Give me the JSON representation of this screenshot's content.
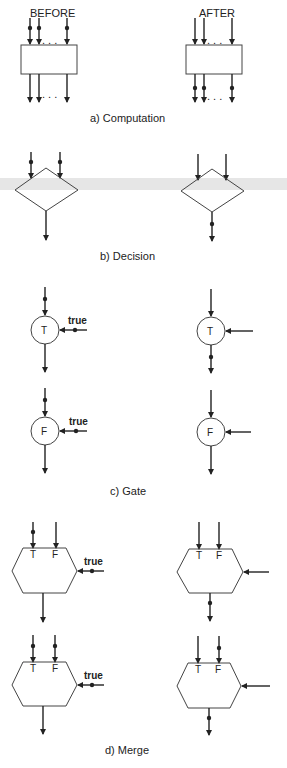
{
  "headers": {
    "before": "BEFORE",
    "after": "AFTER"
  },
  "captions": {
    "computation": "a) Computation",
    "decision": "b) Decision",
    "gate": "c) Gate",
    "merge": "d) Merge"
  },
  "symbols": {
    "t": "T",
    "f": "F",
    "true_label": "true",
    "ellipsis": ". . ."
  },
  "colors": {
    "ink": "#222222",
    "band": "#e6e6e6",
    "background": "#ffffff"
  },
  "panels": [
    {
      "id": "computation",
      "before": "tokens on all inputs",
      "after": "tokens on all outputs"
    },
    {
      "id": "decision",
      "before": "tokens on both inputs",
      "after": "token on output"
    },
    {
      "id": "gate-t",
      "before": "data token + true control",
      "after": "token passed to output"
    },
    {
      "id": "gate-f",
      "before": "data token + true control",
      "after": "token absorbed, no output"
    },
    {
      "id": "merge-1",
      "before": "token on T input + true control",
      "after": "token on output"
    },
    {
      "id": "merge-2",
      "before": "tokens on T and F inputs + true control",
      "after": "token on output, F token remains"
    }
  ]
}
